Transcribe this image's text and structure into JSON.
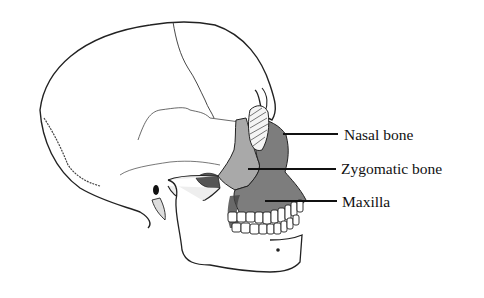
{
  "diagram": {
    "labels": [
      {
        "id": "nasal",
        "text": "Nasal bone",
        "x": 344,
        "y": 127,
        "line_from": [
          283,
          134
        ],
        "line_to": [
          338,
          134
        ]
      },
      {
        "id": "zygomatic",
        "text": "Zygomatic bone",
        "x": 341,
        "y": 160,
        "line_from": [
          248,
          169
        ],
        "line_to": [
          336,
          169
        ]
      },
      {
        "id": "maxilla",
        "text": "Maxilla",
        "x": 342,
        "y": 193,
        "line_from": [
          265,
          201
        ],
        "line_to": [
          337,
          201
        ]
      }
    ],
    "colors": {
      "outline": "#222222",
      "zygomatic_fill": "#a9a9a9",
      "maxilla_fill": "#7d7d7d",
      "nasal_fill": "#8a8a8a",
      "background": "#ffffff"
    }
  }
}
